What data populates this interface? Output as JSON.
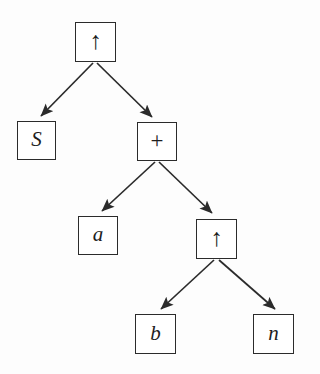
{
  "figure": {
    "type": "binary-tree-diagram",
    "background_color": "#fdfdfd",
    "stroke_color": "#2b2b2b",
    "text_color": "#1d1d1d"
  },
  "nodes": [
    {
      "id": "root",
      "label": "↑",
      "kind": "operator",
      "x": 75,
      "y": 22,
      "w": 41,
      "h": 40
    },
    {
      "id": "n_s",
      "label": "S",
      "kind": "italic",
      "x": 17,
      "y": 121,
      "w": 39,
      "h": 39
    },
    {
      "id": "n_plus",
      "label": "+",
      "kind": "operator",
      "x": 137,
      "y": 122,
      "w": 40,
      "h": 39
    },
    {
      "id": "n_a",
      "label": "a",
      "kind": "italic",
      "x": 78,
      "y": 216,
      "w": 40,
      "h": 39
    },
    {
      "id": "n_up2",
      "label": "↑",
      "kind": "operator",
      "x": 196,
      "y": 219,
      "w": 41,
      "h": 40
    },
    {
      "id": "n_b",
      "label": "b",
      "kind": "italic",
      "x": 135,
      "y": 314,
      "w": 41,
      "h": 40
    },
    {
      "id": "n_n",
      "label": "n",
      "kind": "italic",
      "x": 253,
      "y": 314,
      "w": 41,
      "h": 40
    }
  ],
  "edges": [
    {
      "id": "e-root-s",
      "from": "root",
      "to": "n_s",
      "x1": 93,
      "y1": 63,
      "x2": 41,
      "y2": 116
    },
    {
      "id": "e-root-plus",
      "from": "root",
      "to": "n_plus",
      "x1": 97,
      "y1": 63,
      "x2": 152,
      "y2": 117
    },
    {
      "id": "e-plus-a",
      "from": "n_plus",
      "to": "n_a",
      "x1": 155,
      "y1": 162,
      "x2": 102,
      "y2": 211
    },
    {
      "id": "e-plus-up",
      "from": "n_plus",
      "to": "n_up2",
      "x1": 159,
      "y1": 162,
      "x2": 212,
      "y2": 213
    },
    {
      "id": "e-up-b",
      "from": "n_up2",
      "to": "n_b",
      "x1": 214,
      "y1": 260,
      "x2": 161,
      "y2": 309
    },
    {
      "id": "e-up-n",
      "from": "n_up2",
      "to": "n_n",
      "x1": 219,
      "y1": 260,
      "x2": 275,
      "y2": 309
    }
  ]
}
